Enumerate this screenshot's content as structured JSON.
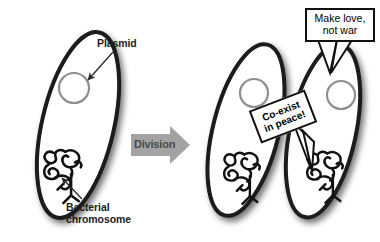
{
  "figure": {
    "background_color": "#ffffff"
  },
  "labels": {
    "plasmid": "Plasmid",
    "bacterial_chromosome": "Bacterial\nchromosome"
  },
  "process": {
    "arrow_label": "Division",
    "arrow_fill": "#a3a3a3",
    "arrow_text_color": "#4a4a4a"
  },
  "speech_bubbles": [
    {
      "id": "make-love",
      "text": "Make love,\nnot war",
      "border_color": "#111111",
      "fill": "#ffffff"
    },
    {
      "id": "coexist",
      "text": "Co-exist\nin peace!",
      "border_color": "#111111",
      "fill": "#ffffff"
    }
  ],
  "cells": [
    {
      "id": "parent-cell",
      "side": "left",
      "outline_color": "#1a1a1a",
      "fill": "#ffffff",
      "has_plasmid": true,
      "has_chromosome": true
    },
    {
      "id": "daughter-cell-1",
      "side": "right-left",
      "outline_color": "#1a1a1a",
      "fill": "#ffffff",
      "has_plasmid": true,
      "has_chromosome": true
    },
    {
      "id": "daughter-cell-2",
      "side": "right-right",
      "outline_color": "#1a1a1a",
      "fill": "#ffffff",
      "has_plasmid": true,
      "has_chromosome": true
    }
  ],
  "structures": {
    "plasmid_stroke": "#8f8f8f",
    "chromosome_stroke": "#111111",
    "leader_line_color": "#2b2b2b"
  }
}
